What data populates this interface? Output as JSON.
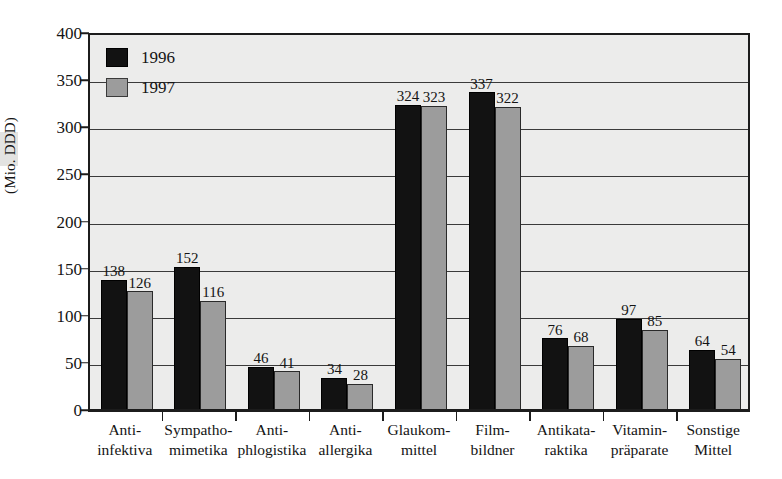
{
  "chart_data": {
    "type": "bar",
    "title": "",
    "xlabel": "",
    "ylabel": "(Mio. DDD)",
    "ylim": [
      0,
      400
    ],
    "ytick_step": 50,
    "yticks": [
      0,
      50,
      100,
      150,
      200,
      250,
      300,
      350,
      400
    ],
    "ytick_labels": [
      "0",
      "50",
      "100",
      "150",
      "200",
      "250",
      "300",
      "350",
      "400"
    ],
    "grid": true,
    "grid_axis": "y",
    "legend_position": "inside-top-left",
    "value_labels": true,
    "categories": [
      "Anti-infektiva",
      "Sympatho-mimetika",
      "Anti-phlogistika",
      "Anti-allergika",
      "Glaukom-mittel",
      "Film-bildner",
      "Antikata-raktika",
      "Vitamin-präparate",
      "Sonstige Mittel"
    ],
    "category_lines": [
      [
        "Anti-",
        "infektiva"
      ],
      [
        "Sympatho-",
        "mimetika"
      ],
      [
        "Anti-",
        "phlogistika"
      ],
      [
        "Anti-",
        "allergika"
      ],
      [
        "Glaukom-",
        "mittel"
      ],
      [
        "Film-",
        "bildner"
      ],
      [
        "Antikata-",
        "raktika"
      ],
      [
        "Vitamin-",
        "präparate"
      ],
      [
        "Sonstige",
        "Mittel"
      ]
    ],
    "series": [
      {
        "name": "1996",
        "color": "#121212",
        "values": [
          138,
          152,
          46,
          34,
          324,
          337,
          76,
          97,
          64
        ],
        "value_labels": [
          "138",
          "152",
          "46",
          "34",
          "324",
          "337",
          "76",
          "97",
          "64"
        ]
      },
      {
        "name": "1997",
        "color": "#9c9c9c",
        "values": [
          126,
          116,
          41,
          28,
          323,
          322,
          68,
          85,
          54
        ],
        "value_labels": [
          "126",
          "116",
          "41",
          "28",
          "323",
          "322",
          "68",
          "85",
          "54"
        ]
      }
    ]
  },
  "legend": {
    "items": [
      {
        "label": "1996",
        "color": "#121212"
      },
      {
        "label": "1997",
        "color": "#9c9c9c"
      }
    ]
  },
  "axes": {
    "y_title": "(Mio. DDD)"
  },
  "colors": {
    "plot_background": "#ececeb",
    "axis": "#1c1c1c",
    "gridline": "#3a3a3a",
    "series_1996": "#121212",
    "series_1997": "#9c9c9c",
    "text": "#141414"
  }
}
